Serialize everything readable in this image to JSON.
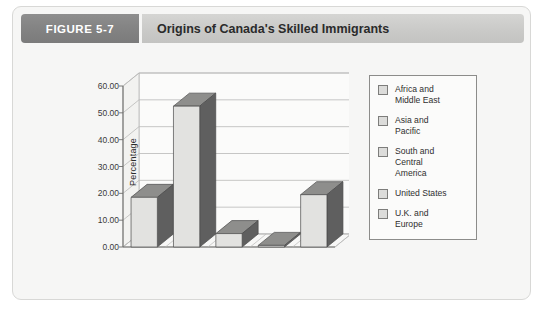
{
  "figure": {
    "badge": "FIGURE 5-7",
    "title": "Origins of Canada's Skilled Immigrants"
  },
  "colors": {
    "badge_bg": "#848484",
    "title_bg": "#cbcbc9",
    "card_bg": "#f6f6f5",
    "bar_front": "#e2e2e0",
    "bar_side": "#5f5f5f",
    "bar_top": "#8e8e8c",
    "grid": "#b9b9b7",
    "axis": "#6e6e6c",
    "legend_swatch": "#dcdcda"
  },
  "chart_data": {
    "type": "bar",
    "title": "Origins of Canada's Skilled Immigrants",
    "xlabel": "Country of origin",
    "ylabel": "Percentage",
    "ylim": [
      0,
      60
    ],
    "yticks": [
      "0.00",
      "10.00",
      "20.00",
      "30.00",
      "40.00",
      "50.00",
      "60.00"
    ],
    "ytick_values": [
      0,
      10,
      20,
      30,
      40,
      50,
      60
    ],
    "grid": true,
    "legend_position": "right",
    "three_d": true,
    "categories": [
      "Africa and Middle East",
      "Asia and Pacific",
      "South and Central America",
      "United States",
      "U.K. and Europe"
    ],
    "values": [
      18.5,
      52.5,
      5.0,
      0.6,
      19.5
    ]
  },
  "legend": {
    "items": [
      {
        "label": "Africa and\nMiddle East"
      },
      {
        "label": "Asia and\nPacific"
      },
      {
        "label": "South and\nCentral\nAmerica"
      },
      {
        "label": "United States"
      },
      {
        "label": "U.K. and\nEurope"
      }
    ]
  }
}
